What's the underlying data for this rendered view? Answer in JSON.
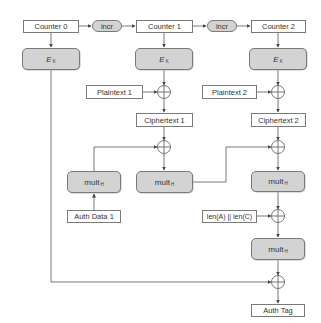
{
  "diagram": {
    "type": "GCM authenticated encryption flow",
    "counters": [
      {
        "label": "Counter 0"
      },
      {
        "label": "Counter 1"
      },
      {
        "label": "Counter 2"
      }
    ],
    "increments": [
      {
        "label": "incr"
      },
      {
        "label": "incr"
      }
    ],
    "encryptors": [
      {
        "main": "E",
        "sub": "K"
      },
      {
        "main": "E",
        "sub": "K"
      },
      {
        "main": "E",
        "sub": "K"
      }
    ],
    "plaintexts": [
      {
        "label": "Plaintext 1"
      },
      {
        "label": "Plaintext 2"
      }
    ],
    "ciphertexts": [
      {
        "label": "Ciphertext 1"
      },
      {
        "label": "Ciphertext 2"
      }
    ],
    "multipliers": [
      {
        "main": "mult",
        "sub": "H"
      },
      {
        "main": "mult",
        "sub": "H"
      },
      {
        "main": "mult",
        "sub": "H"
      },
      {
        "main": "mult",
        "sub": "H"
      }
    ],
    "auth_data": {
      "label": "Auth Data 1"
    },
    "lengths": {
      "label": "len(A) || len(C)"
    },
    "auth_tag": {
      "label": "Auth Tag"
    },
    "colors": {
      "line": "#555555",
      "box_border": "#7a7a7a",
      "op_fill": "#d3d3d3",
      "background": "#ffffff"
    }
  }
}
